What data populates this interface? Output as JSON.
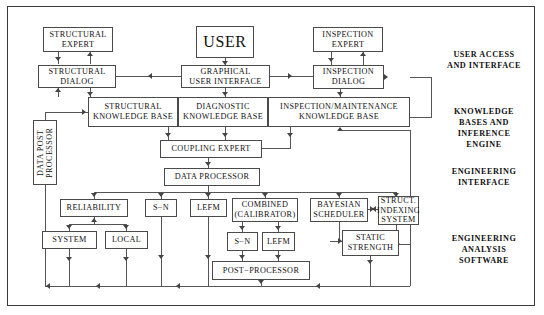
{
  "diagram": {
    "frame": {
      "border_color": "#3a3a3a"
    },
    "boxes": [
      {
        "id": "structural-expert",
        "label": "STRUCTURAL\nEXPERT"
      },
      {
        "id": "user",
        "label": "USER"
      },
      {
        "id": "inspection-expert",
        "label": "INSPECTION\nEXPERT"
      },
      {
        "id": "structural-dialog",
        "label": "STRUCTURAL\nDIALOG"
      },
      {
        "id": "graphical-user-interface",
        "label": "GRAPHICAL\nUSER  INTERFACE"
      },
      {
        "id": "inspection-dialog",
        "label": "INSPECTION\nDIALOG"
      },
      {
        "id": "structural-knowledge-base",
        "label": "STRUCTURAL\nKNOWLEDGE  BASE"
      },
      {
        "id": "diagnostic-knowledge-base",
        "label": "DIAGNOSTIC\nKNOWLEDGE  BASE"
      },
      {
        "id": "inspection-maintenance-knowledge-base",
        "label": "INSPECTION/MAINTENANCE\nKNOWLEDGE  BASE"
      },
      {
        "id": "coupling-expert",
        "label": "COUPLING  EXPERT"
      },
      {
        "id": "data-processor",
        "label": "DATA  PROCESSOR"
      },
      {
        "id": "data-post-processor",
        "label": "DATA  POST\nPROCESSOR"
      },
      {
        "id": "reliability",
        "label": "RELIABILITY"
      },
      {
        "id": "sn-upper",
        "label": "S−N"
      },
      {
        "id": "lefm-upper",
        "label": "LEFM"
      },
      {
        "id": "combined-calibrator",
        "label": "COMBINED\n(CALIBRATOR)"
      },
      {
        "id": "bayesian-scheduler",
        "label": "BAYESIAN\nSCHEDULER"
      },
      {
        "id": "struct-indexing-system",
        "label": "STRUCT.\nINDEXING\nSYSTEM"
      },
      {
        "id": "system",
        "label": "SYSTEM"
      },
      {
        "id": "local",
        "label": "LOCAL"
      },
      {
        "id": "sn-lower",
        "label": "S−N"
      },
      {
        "id": "lefm-lower",
        "label": "LEFM"
      },
      {
        "id": "static-strength",
        "label": "STATIC\nSTRENGTH"
      },
      {
        "id": "post-processor",
        "label": "POST−PROCESSOR"
      }
    ],
    "group_labels": [
      {
        "id": "user-access-and-interface",
        "label": "USER  ACCESS\nAND  INTERFACE"
      },
      {
        "id": "knowledge-bases-and-inference-engine",
        "label": "KNOWLEDGE\nBASES  AND\nINFERENCE\nENGINE"
      },
      {
        "id": "engineering-interface",
        "label": "ENGINEERING\nINTERFACE"
      },
      {
        "id": "engineering-analysis-software",
        "label": "ENGINEERING\nANALYSIS\nSOFTWARE"
      }
    ]
  }
}
